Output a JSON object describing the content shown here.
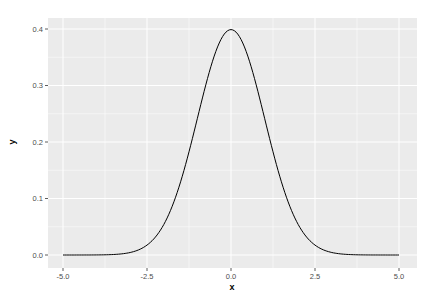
{
  "chart_data": {
    "type": "line",
    "title": "",
    "xlabel": "x",
    "ylabel": "y",
    "xlim": [
      -5,
      5
    ],
    "ylim": [
      0,
      0.4
    ],
    "x_ticks": [
      "-5.0",
      "-2.5",
      "0.0",
      "2.5",
      "5.0"
    ],
    "y_ticks": [
      "0.0",
      "0.1",
      "0.2",
      "0.3",
      "0.4"
    ],
    "grid": true,
    "legend": null,
    "series": [
      {
        "name": "dnorm(x)",
        "description": "Standard normal density, mean 0, sd 1",
        "x": [
          -5,
          -4,
          -3,
          -2.5,
          -2,
          -1.5,
          -1,
          -0.5,
          0,
          0.5,
          1,
          1.5,
          2,
          2.5,
          3,
          4,
          5
        ],
        "values": [
          0.0,
          0.0001,
          0.0044,
          0.0175,
          0.054,
          0.1295,
          0.242,
          0.3521,
          0.3989,
          0.3521,
          0.242,
          0.1295,
          0.054,
          0.0175,
          0.0044,
          0.0001,
          0.0
        ]
      }
    ]
  },
  "colors": {
    "panel_bg": "#ebebeb",
    "grid": "#ffffff",
    "line": "#000000"
  }
}
